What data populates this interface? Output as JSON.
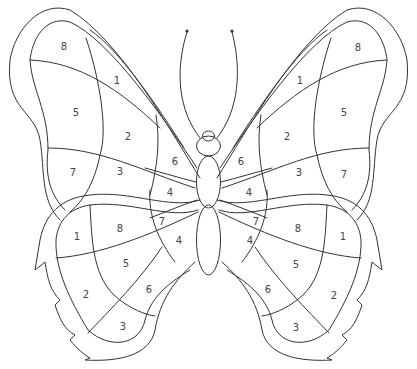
{
  "line_color": "#333333",
  "background": "#ffffff",
  "labels": {
    "ul": [
      "8",
      "1",
      "5",
      "2",
      "7",
      "3",
      "6"
    ],
    "ur": [
      "8",
      "1",
      "5",
      "2",
      "7",
      "3",
      "6"
    ],
    "body": [
      "4",
      "4",
      "7",
      "7",
      "4",
      "4"
    ],
    "ll": [
      "1",
      "8",
      "5",
      "2",
      "6",
      "3"
    ],
    "lr": [
      "1",
      "8",
      "5",
      "2",
      "6",
      "3"
    ]
  }
}
